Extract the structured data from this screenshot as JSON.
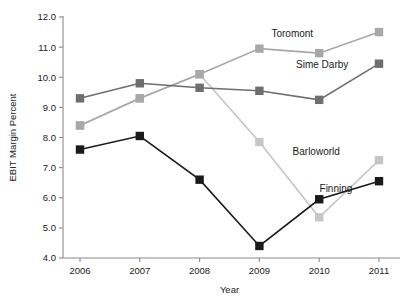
{
  "chart_data": {
    "type": "line",
    "title": "",
    "xlabel": "Year",
    "ylabel": "EBIT Margin Percent",
    "categories": [
      "2006",
      "2007",
      "2008",
      "2009",
      "2010",
      "2011"
    ],
    "x": [
      2006,
      2007,
      2008,
      2009,
      2010,
      2011
    ],
    "ylim": [
      4.0,
      12.0
    ],
    "xlim": [
      2006,
      2011
    ],
    "yticks": [
      "4.0",
      "5.0",
      "6.0",
      "7.0",
      "8.0",
      "9.0",
      "10.0",
      "11.0",
      "12.0"
    ],
    "ytick_values": [
      4.0,
      5.0,
      6.0,
      7.0,
      8.0,
      9.0,
      10.0,
      11.0,
      12.0
    ],
    "grid": false,
    "legend_position": "inline-labels",
    "marker": "square",
    "series": [
      {
        "name": "Toromont",
        "color": "#a8a8a8",
        "label": "Toromont",
        "values": [
          8.4,
          9.3,
          10.1,
          10.95,
          10.8,
          11.5
        ]
      },
      {
        "name": "Sime Darby",
        "color": "#6e6e6e",
        "label": "Sime Darby",
        "values": [
          9.3,
          9.8,
          9.65,
          9.55,
          9.25,
          10.45
        ]
      },
      {
        "name": "Barloworld",
        "color": "#c6c6c6",
        "label": "Barloworld",
        "values": [
          8.4,
          9.3,
          10.1,
          7.85,
          5.35,
          7.25
        ]
      },
      {
        "name": "Finning",
        "color": "#1a1a1a",
        "label": "Finning",
        "values": [
          7.6,
          8.05,
          6.6,
          4.4,
          5.95,
          6.55
        ]
      }
    ],
    "annotations": [
      {
        "text": "Toromont",
        "x": 2009.55,
        "y": 11.35
      },
      {
        "text": "Sime Darby",
        "x": 2010.05,
        "y": 10.32
      },
      {
        "text": "Barloworld",
        "x": 2009.95,
        "y": 7.42
      },
      {
        "text": "Finning",
        "x": 2010.28,
        "y": 6.2
      }
    ]
  }
}
